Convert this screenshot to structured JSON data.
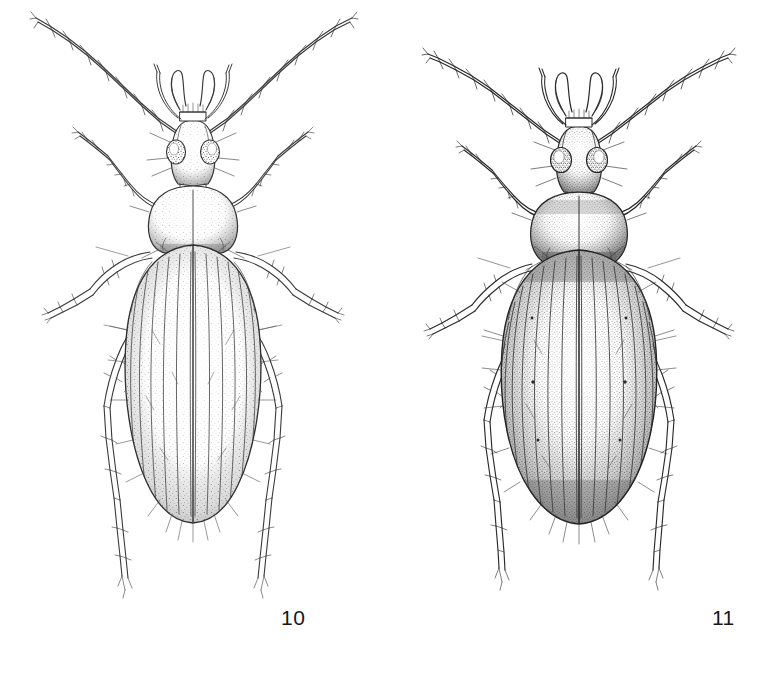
{
  "plate": {
    "background_color": "#ffffff",
    "ink_color": "#2b2b2b",
    "style": "stippled ink line drawing",
    "caption_color": "#161616"
  },
  "figures": [
    {
      "number": "10",
      "label": "10",
      "subject": "ground beetle dorsal habitus",
      "form": "slender elongate-oval elytra, lightly stippled",
      "antennae": "long filiform, 11 segments, bristled, directed upward and outward",
      "elytra_striae": 8,
      "shading": "light",
      "body_outline_color": "#3a3a3a"
    },
    {
      "number": "11",
      "label": "11",
      "subject": "ground beetle dorsal habitus",
      "form": "broad robust oval elytra, heavily stippled",
      "antennae": "long filiform, 11 segments, bristled, directed upward and outward",
      "elytra_striae": 9,
      "shading": "dark",
      "body_outline_color": "#2a2a2a"
    }
  ]
}
